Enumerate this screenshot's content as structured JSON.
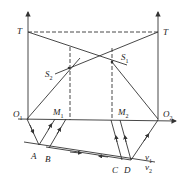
{
  "diagram": {
    "type": "geometric-optics / timing diagram",
    "labels": {
      "T_left": "T",
      "T_right": "T",
      "S1": "S",
      "S1_sub": "1",
      "S2": "S",
      "S2_sub": "2",
      "O1": "O",
      "O1_sub": "1",
      "O2": "O",
      "O2_sub": "2",
      "M1": "M",
      "M1_sub": "1",
      "M2": "M",
      "M2_sub": "2",
      "A": "A",
      "B": "B",
      "C": "C",
      "D": "D",
      "v1": "v",
      "v1_sub": "1",
      "v2": "v",
      "v2_sub": "2"
    },
    "colors": {
      "line": "#333333",
      "background": "#ffffff"
    }
  }
}
